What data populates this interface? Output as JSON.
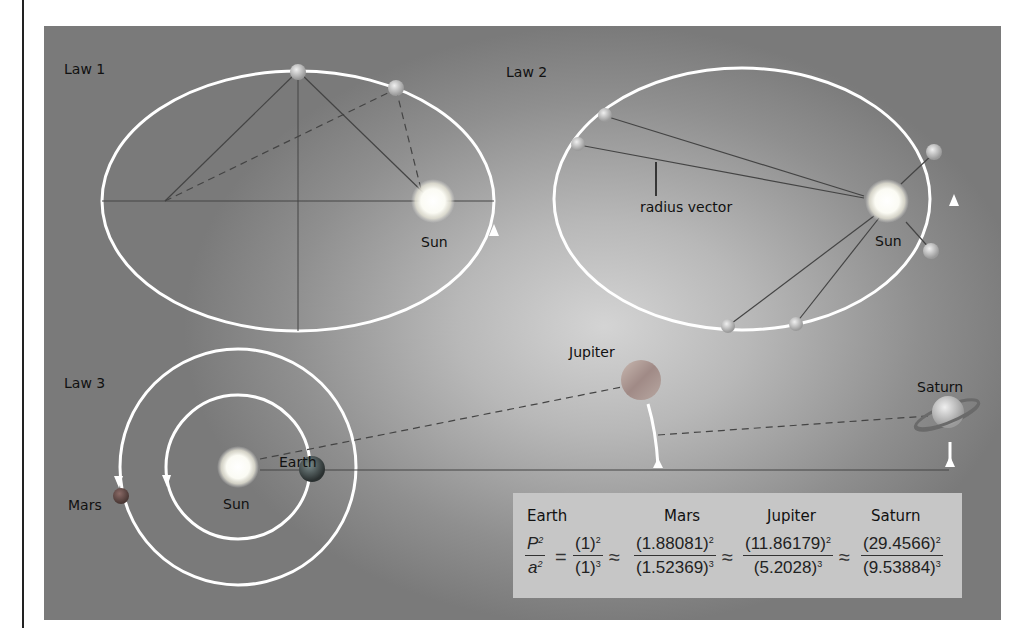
{
  "figure": {
    "background_color": "#9a9a9a",
    "orbit_color": "#ffffff"
  },
  "law1": {
    "label": "Law 1",
    "sun_label": "Sun"
  },
  "law2": {
    "label": "Law 2",
    "radius_vector_label": "radius vector",
    "sun_label": "Sun"
  },
  "law3": {
    "label": "Law 3",
    "sun_label": "Sun",
    "planets": {
      "mars": "Mars",
      "earth": "Earth",
      "jupiter": "Jupiter",
      "saturn": "Saturn"
    }
  },
  "formula": {
    "headers": [
      "Earth",
      "Mars",
      "Jupiter",
      "Saturn"
    ],
    "lhs": {
      "num": "P",
      "num_exp": "2",
      "den": "a",
      "den_exp": "2"
    },
    "equals": "=",
    "approx": "≈",
    "terms": [
      {
        "planet": "Earth",
        "P": "(1)",
        "P_exp": "2",
        "a": "(1)",
        "a_exp": "3"
      },
      {
        "planet": "Mars",
        "P": "(1.88081)",
        "P_exp": "2",
        "a": "(1.52369)",
        "a_exp": "3"
      },
      {
        "planet": "Jupiter",
        "P": "(11.86179)",
        "P_exp": "2",
        "a": "(5.2028)",
        "a_exp": "3"
      },
      {
        "planet": "Saturn",
        "P": "(29.4566)",
        "P_exp": "2",
        "a": "(9.53884)",
        "a_exp": "3"
      }
    ]
  }
}
